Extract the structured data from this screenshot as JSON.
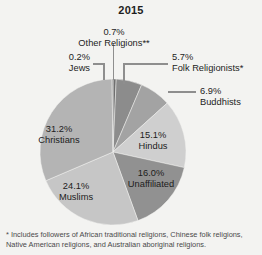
{
  "chart_data": {
    "type": "pie",
    "title": "2015",
    "xlabel": "",
    "ylabel": "",
    "units": "percent",
    "legend_position": "none",
    "grid": false,
    "start_angle_deg": 0,
    "direction": "clockwise",
    "categories": [
      "Other Religions**",
      "Folk Religionists*",
      "Buddhists",
      "Hindus",
      "Unaffiliated",
      "Muslims",
      "Christians",
      "Jews"
    ],
    "values": [
      0.7,
      5.7,
      6.9,
      15.1,
      16.0,
      24.1,
      31.2,
      0.2
    ],
    "labels": [
      "0.7%",
      "5.7%",
      "6.9%",
      "15.1%",
      "16.0%",
      "24.1%",
      "31.2%",
      "0.2%"
    ],
    "colors": [
      "#6f6f6f",
      "#8c8c8c",
      "#a3a3a3",
      "#cfcfcf",
      "#919191",
      "#c6c6c6",
      "#b4b4b4",
      "#7c7c7c"
    ],
    "slices": [
      {
        "name": "Other Religions**",
        "value": 0.7,
        "label": "0.7%",
        "color": "#6f6f6f",
        "label_placement": "outside-top"
      },
      {
        "name": "Folk Religionists*",
        "value": 5.7,
        "label": "5.7%",
        "color": "#8c8c8c",
        "label_placement": "outside-right"
      },
      {
        "name": "Buddhists",
        "value": 6.9,
        "label": "6.9%",
        "color": "#a3a3a3",
        "label_placement": "outside-right"
      },
      {
        "name": "Hindus",
        "value": 15.1,
        "label": "15.1%",
        "color": "#cfcfcf",
        "label_placement": "inside"
      },
      {
        "name": "Unaffiliated",
        "value": 16.0,
        "label": "16.0%",
        "color": "#919191",
        "label_placement": "inside"
      },
      {
        "name": "Muslims",
        "value": 24.1,
        "label": "24.1%",
        "color": "#c6c6c6",
        "label_placement": "inside"
      },
      {
        "name": "Christians",
        "value": 31.2,
        "label": "31.2%",
        "color": "#b4b4b4",
        "label_placement": "inside"
      },
      {
        "name": "Jews",
        "value": 0.2,
        "label": "0.2%",
        "color": "#7c7c7c",
        "label_placement": "outside-left"
      }
    ]
  },
  "labels": {
    "other_religions": {
      "pct": "0.7%",
      "name": "Other Religions**"
    },
    "jews": {
      "pct": "0.2%",
      "name": "Jews"
    },
    "folk": {
      "pct": "5.7%",
      "name": "Folk Religionists*"
    },
    "buddhists": {
      "pct": "6.9%",
      "name": "Buddhists"
    },
    "hindus": {
      "pct": "15.1%",
      "name": "Hindus"
    },
    "unaffiliated": {
      "pct": "16.0%",
      "name": "Unaffiliated"
    },
    "muslims": {
      "pct": "24.1%",
      "name": "Muslims"
    },
    "christians": {
      "pct": "31.2%",
      "name": "Christians"
    }
  },
  "footnote": "* Includes followers of African traditional religions, Chinese folk religions, Native American religions, and Australian aboriginal religions.",
  "colors": {
    "background": "#f3f3f1",
    "text": "#232323",
    "title": "#1e1e1e",
    "leader_line": "#8e8e8e",
    "footnote": "#4a4a4a"
  }
}
